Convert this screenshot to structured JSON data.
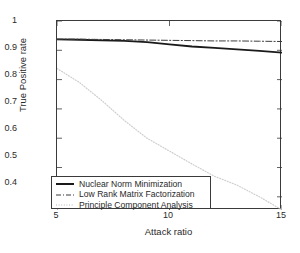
{
  "chart_data": {
    "type": "line",
    "title": "",
    "xlabel": "Attack ratio",
    "ylabel": "True Positive rate",
    "xlim": [
      5,
      15
    ],
    "ylim": [
      0.355,
      1.0
    ],
    "xticks": [
      5,
      10,
      15
    ],
    "xtick_labels": [
      "5",
      "10",
      "15"
    ],
    "yticks": [
      0.4,
      0.5,
      0.6,
      0.7,
      0.8,
      0.9,
      1
    ],
    "ytick_labels": [
      "0.4",
      "0.5",
      "0.6",
      "0.7",
      "0.8",
      "0.9",
      "1"
    ],
    "grid": false,
    "legend_position": "lower left",
    "x": [
      5,
      6,
      7,
      8,
      9,
      10,
      11,
      12,
      13,
      14,
      15
    ],
    "series": [
      {
        "name": "Nuclear Norm Minimization",
        "style": "solid",
        "color": "#1a1a1a",
        "width": 1.8,
        "values": [
          0.937,
          0.936,
          0.934,
          0.932,
          0.928,
          0.92,
          0.913,
          0.908,
          0.903,
          0.898,
          0.892
        ]
      },
      {
        "name": "Low Rank Matrix Factorization",
        "style": "dash-dot",
        "color": "#3d3d3d",
        "width": 1.0,
        "values": [
          0.938,
          0.938,
          0.937,
          0.936,
          0.935,
          0.934,
          0.933,
          0.932,
          0.932,
          0.931,
          0.93
        ]
      },
      {
        "name": "Principle Component Analysis",
        "style": "dotted",
        "color": "#cfcfcf",
        "width": 1.2,
        "values": [
          0.838,
          0.79,
          0.728,
          0.66,
          0.6,
          0.556,
          0.512,
          0.47,
          0.44,
          0.4,
          0.355
        ]
      }
    ]
  },
  "axes": {
    "ytick_labels": [
      "1",
      "0.9",
      "0.8",
      "0.7",
      "0.6",
      "0.5",
      "0.4"
    ],
    "xtick_labels": [
      "5",
      "10",
      "15"
    ],
    "xlabel": "Attack ratio",
    "ylabel": "True Positive rate"
  },
  "legend": {
    "items": [
      {
        "label": "Nuclear Norm Minimization"
      },
      {
        "label": "Low Rank Matrix Factorization"
      },
      {
        "label": "Principle Component Analysis"
      }
    ]
  }
}
